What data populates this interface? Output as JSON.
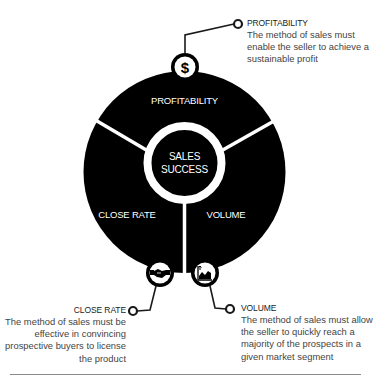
{
  "diagram": {
    "center": {
      "line1": "SALES",
      "line2": "SUCCESS"
    },
    "segments": [
      {
        "label": "PROFITABILITY",
        "icon": "dollar-icon"
      },
      {
        "label": "CLOSE RATE",
        "icon": "handshake-icon"
      },
      {
        "label": "VOLUME",
        "icon": "growth-chart-icon"
      }
    ],
    "colors": {
      "fill": "#000000",
      "divider": "#ffffff",
      "connector": "#1a1a1a",
      "text_on_dark": "#ffffff"
    }
  },
  "callouts": {
    "profitability": {
      "title": "PROFITABILITY",
      "description": "The method of sales must enable the seller to achieve a sustainable profit"
    },
    "close_rate": {
      "title": "CLOSE RATE",
      "description": "The method of sales must be effective in convincing prospective buyers to license the product"
    },
    "volume": {
      "title": "VOLUME",
      "description": "The method of sales must allow the seller to quickly reach a majority of the prospects in a given market segment"
    }
  }
}
